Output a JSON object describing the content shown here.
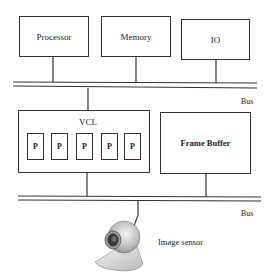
{
  "diagram": {
    "top_components": [
      {
        "label": "Processor"
      },
      {
        "label": "Memory"
      },
      {
        "label": "IO"
      }
    ],
    "buses": [
      {
        "label": "Bus"
      },
      {
        "label": "Bus"
      }
    ],
    "vcl": {
      "label": "VCL",
      "processors": [
        "P",
        "P",
        "P",
        "P",
        "P"
      ]
    },
    "frame_buffer": {
      "label": "Frame Buffer"
    },
    "image_sensor": {
      "label": "Image sensor",
      "icon": "webcam-icon"
    }
  }
}
